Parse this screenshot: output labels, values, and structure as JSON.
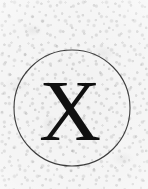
{
  "canvas": {
    "width": 148,
    "height": 189,
    "background_color": "#f2f2f2",
    "medium": "scanned paper with grain texture",
    "alt_text": "A hand-drawn thin circle enclosing a serif capital letter X"
  },
  "mark": {
    "circle": {
      "label": "circle outline",
      "center_x": 72,
      "center_y": 108,
      "radius": 58,
      "stroke_color": "#2e2e2e",
      "stroke_width": 1.1,
      "fill": "none"
    },
    "letter": {
      "label": "letter X",
      "character": "X",
      "color": "#101010",
      "font_style": "serif",
      "font_size_px": 86,
      "center_x": 70,
      "baseline_y": 140,
      "cap_height_px": 62
    }
  },
  "palette": {
    "paper": "#f2f2f2",
    "grain_dark": "#787878",
    "ink_circle": "#2e2e2e",
    "ink_letter": "#101010",
    "highlight": "#ffffff"
  }
}
